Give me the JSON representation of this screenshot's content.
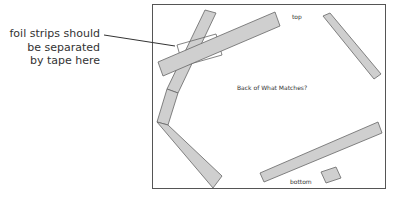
{
  "callout": {
    "lines": [
      "foil strips should",
      "be separated",
      "by tape here"
    ]
  },
  "diagram": {
    "top_label": "top",
    "center_label": "Back of What Matches?",
    "bottom_label": "bottom"
  },
  "colors": {
    "frame": "#555555",
    "strip_fill": "#cfcfcf",
    "strip_stroke": "#666666",
    "text": "#333333"
  }
}
